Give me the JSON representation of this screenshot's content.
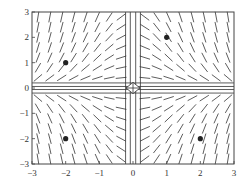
{
  "chart_data": {
    "type": "direction_field",
    "title": "",
    "xlabel": "",
    "ylabel": "",
    "xlim": [
      -3,
      3
    ],
    "ylim": [
      -3,
      3
    ],
    "grid": false,
    "x_ticks": [
      -3,
      -2,
      -1,
      0,
      1,
      2,
      3
    ],
    "y_ticks": [
      3,
      2,
      1,
      0,
      -1,
      -2,
      -3
    ],
    "x_tick_labels": [
      "−3",
      "−2",
      "−1",
      "0",
      "1",
      "2",
      "3"
    ],
    "y_tick_labels": [
      "3",
      "2",
      "1",
      "0",
      "−1",
      "−2",
      "−3"
    ],
    "marked_points": [
      {
        "x": -2,
        "y": 1
      },
      {
        "x": 1,
        "y": 2
      },
      {
        "x": -2,
        "y": -2
      },
      {
        "x": 2,
        "y": -2
      }
    ],
    "field_description": "slope field dy/dx = -x*y style: segments steep near x=0, flat near y=0; hyperbolic pattern around origin",
    "color": "#333333"
  }
}
